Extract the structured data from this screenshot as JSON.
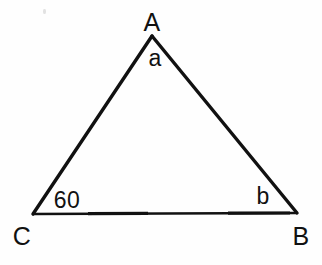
{
  "figure": {
    "kind": "geometry-diagram",
    "shape": "triangle",
    "canvas": {
      "width": 322,
      "height": 265
    },
    "background_color": "#fefefe",
    "stroke_color": "#111111",
    "text_color": "#111111"
  },
  "vertices": {
    "apex": {
      "key": "A",
      "label": "A",
      "x": 152,
      "y": 36,
      "label_x": 152,
      "label_y": 22
    },
    "bottom_left": {
      "key": "C",
      "label": "C",
      "x": 33,
      "y": 214,
      "label_x": 22,
      "label_y": 236
    },
    "bottom_right": {
      "key": "B",
      "label": "B",
      "x": 297,
      "y": 213,
      "label_x": 301,
      "label_y": 236
    }
  },
  "angle_labels": {
    "at_apex": {
      "text": "a",
      "x": 155,
      "y": 58
    },
    "at_bottom_left": {
      "text": "60",
      "x": 67,
      "y": 200
    },
    "at_bottom_right": {
      "text": "b",
      "x": 263,
      "y": 196
    }
  },
  "sides": [
    {
      "name": "left-side",
      "from": "C",
      "to": "A",
      "stroke_width": 3.4
    },
    {
      "name": "right-side",
      "from": "A",
      "to": "B",
      "stroke_width": 3.4
    },
    {
      "name": "base",
      "from": "C",
      "to": "B",
      "stroke_width": 2.4
    }
  ],
  "artifacts": {
    "speck": {
      "x": 43,
      "y": 9
    }
  }
}
